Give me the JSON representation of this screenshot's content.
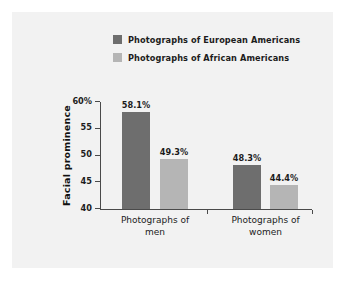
{
  "chart_data": {
    "type": "bar",
    "title": "",
    "xlabel": "",
    "ylabel": "Facial prominence",
    "ylim": [
      40,
      60
    ],
    "yticks": [
      40,
      45,
      50,
      55,
      60
    ],
    "ytick_labels": [
      "40",
      "45",
      "50",
      "55",
      "60%"
    ],
    "grid": false,
    "legend_position": "top",
    "categories": [
      "Photographs of men",
      "Photographs of women"
    ],
    "series": [
      {
        "name": "Photographs of European Americans",
        "color": "#6e6e6e",
        "values": [
          58.1,
          49.3
        ],
        "labels": [
          "58.1%",
          "48.3%"
        ]
      },
      {
        "name": "Photographs of African Americans",
        "color": "#b5b5b5",
        "values": [
          49.3,
          44.4
        ],
        "labels": [
          "49.3%",
          "44.4%"
        ]
      }
    ],
    "bars": [
      {
        "group": 0,
        "series": 0,
        "value": 58.1,
        "label": "58.1%",
        "color": "#6e6e6e"
      },
      {
        "group": 0,
        "series": 1,
        "value": 49.3,
        "label": "49.3%",
        "color": "#b5b5b5"
      },
      {
        "group": 1,
        "series": 0,
        "value": 48.3,
        "label": "48.3%",
        "color": "#6e6e6e"
      },
      {
        "group": 1,
        "series": 1,
        "value": 44.4,
        "label": "44.4%",
        "color": "#b5b5b5"
      }
    ]
  },
  "legend": {
    "items": [
      {
        "label": "Photographs of European Americans",
        "color": "#6e6e6e"
      },
      {
        "label": "Photographs of African Americans",
        "color": "#b5b5b5"
      }
    ]
  },
  "axes": {
    "y_title": "Facial prominence",
    "y_tick_labels": [
      "60%",
      "55",
      "50",
      "45",
      "40"
    ],
    "category_labels": [
      {
        "line1": "Photographs of",
        "line2": "men"
      },
      {
        "line1": "Photographs of",
        "line2": "women"
      }
    ]
  },
  "colors": {
    "series_dark": "#6e6e6e",
    "series_light": "#b5b5b5",
    "panel_background": "#f2f2f2",
    "page_background": "#ffffff",
    "axis": "#4a4a4a",
    "text": "#1c1c1c"
  }
}
